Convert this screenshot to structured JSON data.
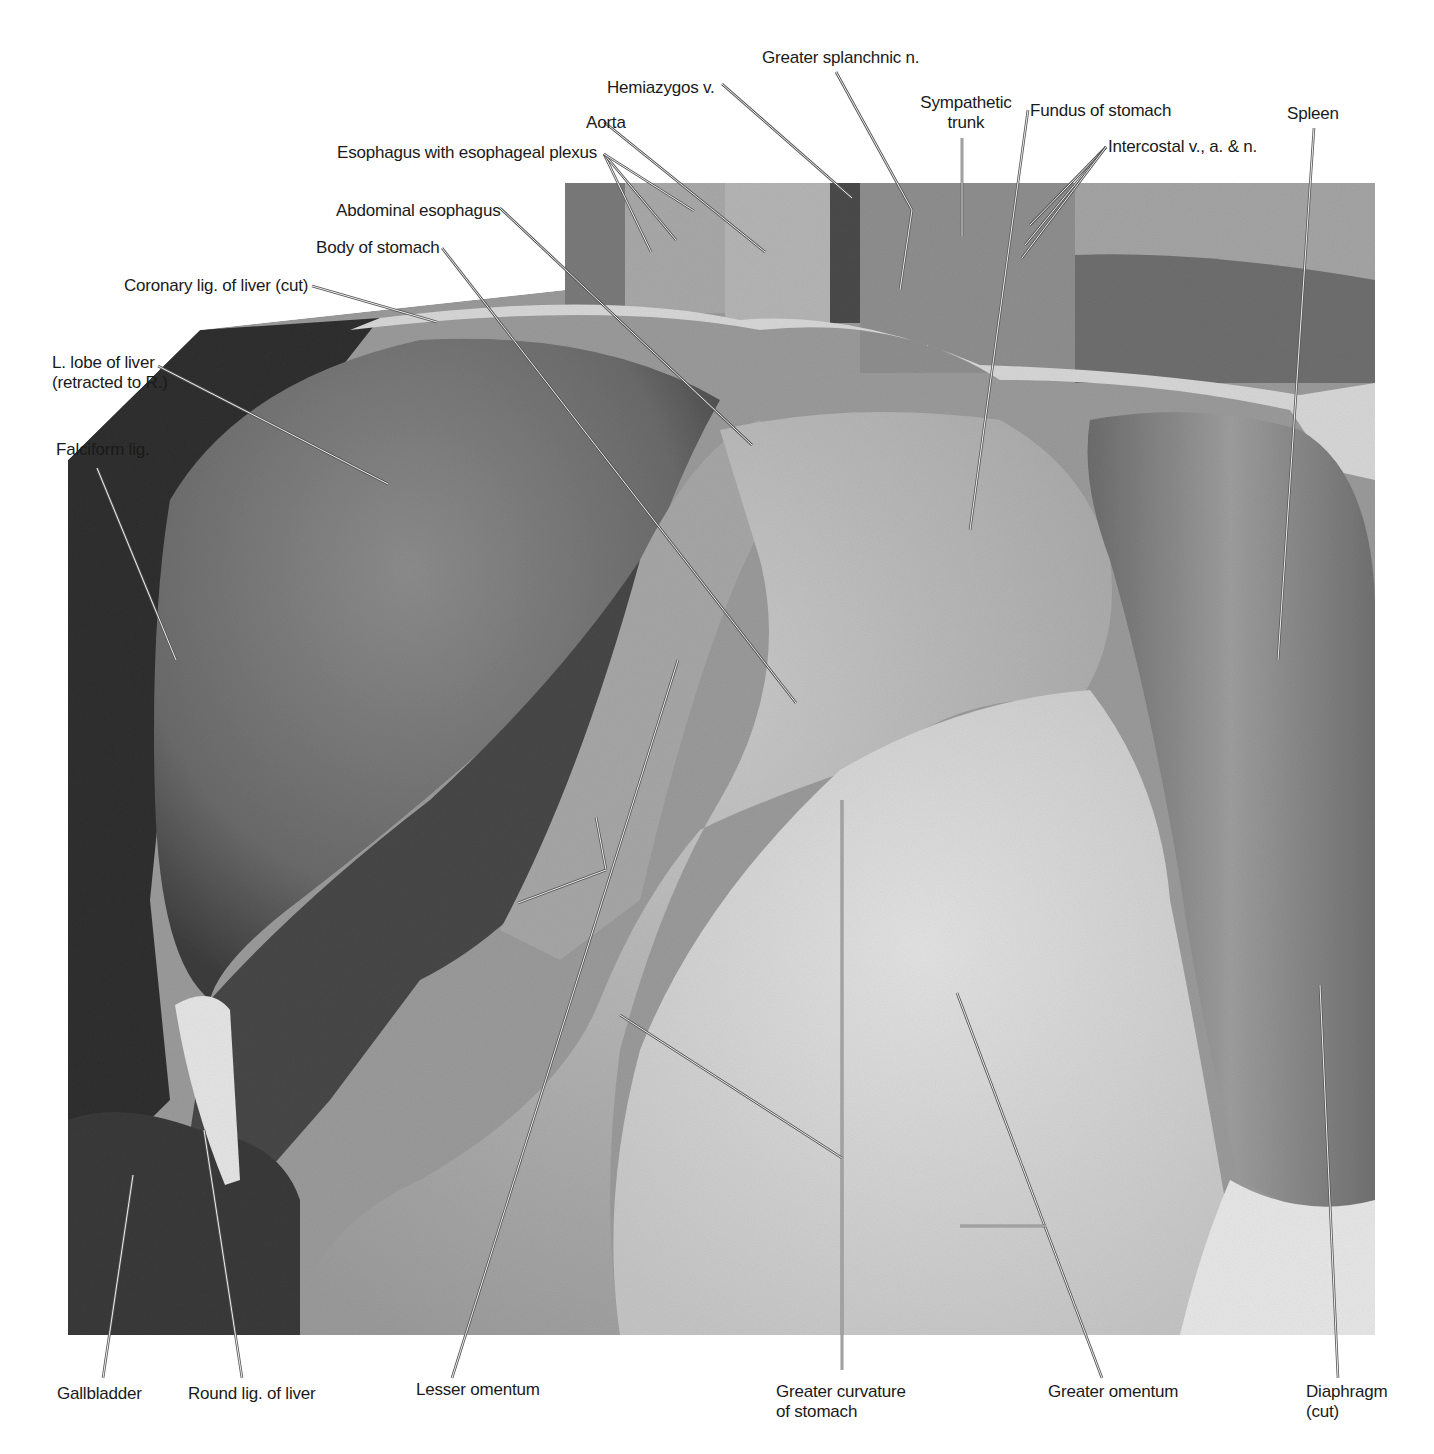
{
  "figure": {
    "background": "#ffffff",
    "photo_bounds": {
      "x": 68,
      "y": 183,
      "w": 1307,
      "h": 1152
    },
    "label_color": "#1a1a1a",
    "leader_color": "#555555"
  },
  "labels": [
    {
      "id": "greater-splanchnic-n",
      "text": "Greater splanchnic n.",
      "x": 762,
      "y": 48,
      "align": "left"
    },
    {
      "id": "hemiazygos-v",
      "text": "Hemiazygos v.",
      "x": 607,
      "y": 78,
      "align": "left"
    },
    {
      "id": "sympathetic-trunk",
      "text": "Sympathetic\ntrunk",
      "x": 916,
      "y": 93,
      "align": "center",
      "w": 100
    },
    {
      "id": "fundus-of-stomach",
      "text": "Fundus of stomach",
      "x": 1030,
      "y": 101,
      "align": "left"
    },
    {
      "id": "spleen",
      "text": "Spleen",
      "x": 1287,
      "y": 104,
      "align": "left"
    },
    {
      "id": "aorta",
      "text": "Aorta",
      "x": 586,
      "y": 113,
      "align": "left"
    },
    {
      "id": "esophagus-plexus",
      "text": "Esophagus with esophageal plexus",
      "x": 337,
      "y": 143,
      "align": "left"
    },
    {
      "id": "intercostal",
      "text": "Intercostal v., a. & n.",
      "x": 1108,
      "y": 137,
      "align": "left"
    },
    {
      "id": "abdominal-esophagus",
      "text": "Abdominal esophagus",
      "x": 336,
      "y": 201,
      "align": "left"
    },
    {
      "id": "body-of-stomach",
      "text": "Body of stomach",
      "x": 316,
      "y": 238,
      "align": "left"
    },
    {
      "id": "coronary-lig",
      "text": "Coronary lig. of liver (cut)",
      "x": 124,
      "y": 276,
      "align": "left"
    },
    {
      "id": "l-lobe-of-liver",
      "text": "L. lobe of liver\n(retracted to R.)",
      "x": 52,
      "y": 353,
      "align": "left"
    },
    {
      "id": "falciform-lig",
      "text": "Falciform lig.",
      "x": 56,
      "y": 440,
      "align": "left"
    },
    {
      "id": "gallbladder",
      "text": "Gallbladder",
      "x": 57,
      "y": 1384,
      "align": "left"
    },
    {
      "id": "round-lig",
      "text": "Round lig. of liver",
      "x": 188,
      "y": 1384,
      "align": "left"
    },
    {
      "id": "lesser-omentum",
      "text": "Lesser omentum",
      "x": 416,
      "y": 1380,
      "align": "left"
    },
    {
      "id": "greater-curvature",
      "text": "Greater curvature\nof stomach",
      "x": 776,
      "y": 1382,
      "align": "left"
    },
    {
      "id": "greater-omentum",
      "text": "Greater omentum",
      "x": 1048,
      "y": 1382,
      "align": "left"
    },
    {
      "id": "diaphragm-cut",
      "text": "Diaphragm\n(cut)",
      "x": 1306,
      "y": 1382,
      "align": "left"
    }
  ],
  "leaders": [
    {
      "for": "greater-splanchnic-n",
      "pts": [
        [
          836,
          72
        ],
        [
          912,
          210
        ],
        [
          900,
          290
        ]
      ]
    },
    {
      "for": "hemiazygos-v",
      "pts": [
        [
          722,
          84
        ],
        [
          852,
          198
        ]
      ]
    },
    {
      "for": "sympathetic-trunk",
      "pts": [
        [
          962,
          138
        ],
        [
          962,
          236
        ]
      ]
    },
    {
      "for": "fundus-of-stomach",
      "pts": [
        [
          1028,
          110
        ],
        [
          970,
          530
        ]
      ]
    },
    {
      "for": "spleen",
      "pts": [
        [
          1314,
          128
        ],
        [
          1278,
          660
        ]
      ]
    },
    {
      "for": "aorta",
      "pts": [
        [
          604,
          122
        ],
        [
          765,
          252
        ]
      ]
    },
    {
      "for": "esophagus-plexus-a",
      "pts": [
        [
          604,
          154
        ],
        [
          651,
          252
        ]
      ]
    },
    {
      "for": "esophagus-plexus-b",
      "pts": [
        [
          604,
          154
        ],
        [
          676,
          240
        ]
      ]
    },
    {
      "for": "esophagus-plexus-c",
      "pts": [
        [
          604,
          154
        ],
        [
          694,
          211
        ]
      ]
    },
    {
      "for": "intercostal-a",
      "pts": [
        [
          1106,
          147
        ],
        [
          1030,
          225
        ]
      ]
    },
    {
      "for": "intercostal-b",
      "pts": [
        [
          1106,
          147
        ],
        [
          1025,
          245
        ]
      ]
    },
    {
      "for": "intercostal-c",
      "pts": [
        [
          1106,
          147
        ],
        [
          1022,
          258
        ]
      ]
    },
    {
      "for": "abdominal-esophagus",
      "pts": [
        [
          500,
          208
        ],
        [
          752,
          445
        ]
      ]
    },
    {
      "for": "body-of-stomach",
      "pts": [
        [
          442,
          248
        ],
        [
          796,
          703
        ]
      ]
    },
    {
      "for": "coronary-lig",
      "pts": [
        [
          312,
          286
        ],
        [
          437,
          322
        ]
      ]
    },
    {
      "for": "l-lobe-of-liver",
      "pts": [
        [
          158,
          366
        ],
        [
          388,
          484
        ]
      ]
    },
    {
      "for": "falciform-lig",
      "pts": [
        [
          97,
          468
        ],
        [
          176,
          660
        ]
      ]
    },
    {
      "for": "lesser-omentum-a",
      "pts": [
        [
          452,
          1378
        ],
        [
          678,
          660
        ]
      ]
    },
    {
      "for": "lesser-omentum-b",
      "pts": [
        [
          606,
          870
        ],
        [
          596,
          817
        ]
      ]
    },
    {
      "for": "lesser-omentum-c",
      "pts": [
        [
          606,
          870
        ],
        [
          518,
          903
        ]
      ]
    },
    {
      "for": "gallbladder",
      "pts": [
        [
          103,
          1378
        ],
        [
          133,
          1175
        ]
      ]
    },
    {
      "for": "round-lig",
      "pts": [
        [
          242,
          1378
        ],
        [
          204,
          1130
        ]
      ]
    },
    {
      "for": "greater-curvature",
      "pts": [
        [
          842,
          1370
        ],
        [
          842,
          800
        ]
      ]
    },
    {
      "for": "greater-curvature-b",
      "pts": [
        [
          842,
          1158
        ],
        [
          620,
          1015
        ]
      ]
    },
    {
      "for": "greater-omentum",
      "pts": [
        [
          1102,
          1378
        ],
        [
          957,
          993
        ]
      ]
    },
    {
      "for": "greater-omentum-b",
      "pts": [
        [
          1046,
          1226
        ],
        [
          960,
          1226
        ]
      ]
    },
    {
      "for": "diaphragm-cut",
      "pts": [
        [
          1338,
          1378
        ],
        [
          1320,
          985
        ]
      ]
    }
  ]
}
